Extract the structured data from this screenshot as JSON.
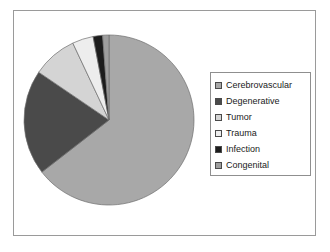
{
  "chart_data": {
    "type": "pie",
    "title": "",
    "categories": [
      "Cerebrovascular",
      "Degenerative",
      "Tumor",
      "Trauma",
      "Infection",
      "Congenital"
    ],
    "values": [
      64.5,
      20.0,
      8.5,
      4.0,
      1.8,
      1.2
    ],
    "unit": "percent",
    "colors": [
      "#a8a8a8",
      "#4a4a4a",
      "#d4d4d4",
      "#ededed",
      "#1c1c1c",
      "#9e9e9e"
    ],
    "legend_position": "right",
    "grid": false,
    "start_angle_deg": 0,
    "direction": "clockwise",
    "xlabel": "",
    "ylabel": ""
  },
  "legend": {
    "items": [
      {
        "label": "Cerebrovascular",
        "color": "#a8a8a8"
      },
      {
        "label": "Degenerative",
        "color": "#4a4a4a"
      },
      {
        "label": "Tumor",
        "color": "#d4d4d4"
      },
      {
        "label": "Trauma",
        "color": "#ededed"
      },
      {
        "label": "Infection",
        "color": "#1c1c1c"
      },
      {
        "label": "Congenital",
        "color": "#9e9e9e"
      }
    ]
  },
  "frame": {
    "border_color": "#9a9a9a",
    "background": "#ffffff"
  }
}
